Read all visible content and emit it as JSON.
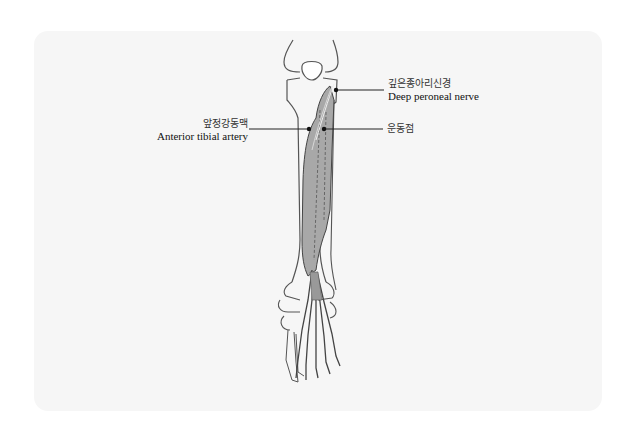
{
  "figure": {
    "title": "",
    "labels": {
      "deep_peroneal_nerve": {
        "ko": "깊은종아리신경",
        "en": "Deep peroneal nerve"
      },
      "anterior_tibial_artery": {
        "ko": "앞정강동맥",
        "en": "Anterior tibial artery"
      },
      "motor_point": {
        "ko": "운동점",
        "en": ""
      }
    },
    "colors": {
      "panel": "#f6f6f6",
      "bone_outline": "#555555",
      "muscle_fill": "#a8a8a8",
      "leader_line": "#222222"
    }
  }
}
